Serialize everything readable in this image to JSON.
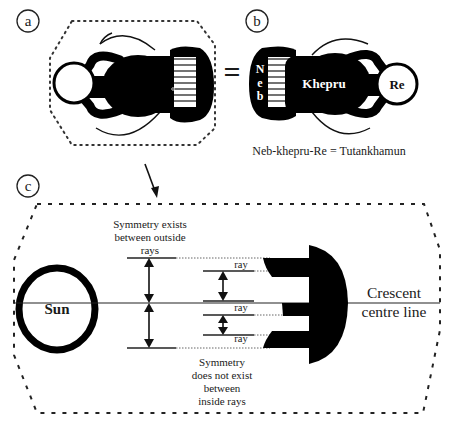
{
  "figure": {
    "panels": {
      "a": {
        "label": "a"
      },
      "b": {
        "label": "b",
        "equals_sign": "=",
        "glyph_labels": {
          "neb_letters": [
            "N",
            "e",
            "b"
          ],
          "khepru": "Khepru",
          "re": "Re"
        },
        "caption": "Neb-khepru-Re = Tutankhamun"
      },
      "c": {
        "label": "c",
        "sun_label": "Sun",
        "outside_note": [
          "Symmetry exists",
          "between outside",
          "rays"
        ],
        "inside_note": [
          "Symmetry",
          "does not exist",
          "between",
          "inside rays"
        ],
        "ray_labels": [
          "ray",
          "ray",
          "ray"
        ],
        "crescent_label": [
          "Crescent",
          "centre line"
        ]
      }
    },
    "colors": {
      "ink": "#000000",
      "text": "#1a1a1a",
      "background": "#ffffff",
      "dotted": "#333333"
    }
  }
}
